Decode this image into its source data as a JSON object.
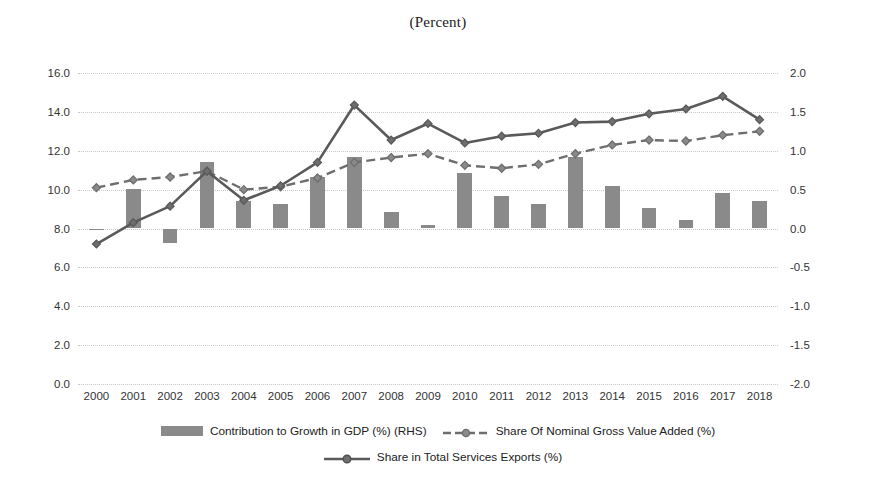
{
  "chart_data": {
    "type": "bar",
    "title": "(Percent)",
    "xlabel": "",
    "ylabel": "",
    "grid": true,
    "legend_position": "bottom",
    "categories": [
      "2000",
      "2001",
      "2002",
      "2003",
      "2004",
      "2005",
      "2006",
      "2007",
      "2008",
      "2009",
      "2010",
      "2011",
      "2012",
      "2013",
      "2014",
      "2015",
      "2016",
      "2017",
      "2018"
    ],
    "axes": {
      "left": {
        "label": "",
        "ylim": [
          0.0,
          16.0
        ],
        "ticks": [
          "16.0",
          "14.0",
          "12.0",
          "10.0",
          "8.0",
          "6.0",
          "4.0",
          "2.0",
          "0.0"
        ],
        "tick_values": [
          16.0,
          14.0,
          12.0,
          10.0,
          8.0,
          6.0,
          4.0,
          2.0,
          0.0
        ]
      },
      "right": {
        "label": "RHS",
        "ylim": [
          -2.0,
          2.0
        ],
        "ticks": [
          "2.0",
          "1.5",
          "1.0",
          "0.5",
          "0.0",
          "-0.5",
          "-1.0",
          "-1.5",
          "-2.0"
        ],
        "tick_values": [
          2.0,
          1.5,
          1.0,
          0.5,
          0.0,
          -0.5,
          -1.0,
          -1.5,
          -2.0
        ]
      }
    },
    "series": [
      {
        "name": "Contribution to Growth in GDP (%) (RHS)",
        "type": "bar",
        "axis": "right",
        "color": "#8a8a8a",
        "values": [
          -0.02,
          0.51,
          -0.19,
          0.86,
          0.36,
          0.31,
          0.66,
          0.92,
          0.21,
          0.05,
          0.71,
          0.42,
          0.31,
          0.92,
          0.55,
          0.26,
          0.11,
          0.46,
          0.36
        ]
      },
      {
        "name": "Share Of Nominal Gross Value Added (%)",
        "type": "line",
        "style": "dashed",
        "axis": "left",
        "color": "#6e6e6e",
        "values": [
          10.1,
          10.5,
          10.65,
          10.95,
          10.0,
          10.15,
          10.6,
          11.4,
          11.65,
          11.85,
          11.25,
          11.1,
          11.3,
          11.85,
          12.3,
          12.55,
          12.5,
          12.8,
          13.0
        ]
      },
      {
        "name": "Share in Total Services Exports (%)",
        "type": "line",
        "style": "solid",
        "axis": "left",
        "color": "#5a5a5a",
        "values": [
          7.2,
          8.3,
          9.15,
          10.95,
          9.45,
          10.2,
          11.4,
          14.35,
          12.55,
          13.4,
          12.4,
          12.75,
          12.9,
          13.45,
          13.5,
          13.9,
          14.15,
          14.8,
          13.6
        ]
      }
    ],
    "legend": [
      {
        "label": "Contribution to Growth in GDP (%) (RHS)",
        "marker": "bar-swatch"
      },
      {
        "label": "Share Of Nominal Gross Value Added (%)",
        "marker": "dashed-diamond-line"
      },
      {
        "label": "Share in Total Services Exports (%)",
        "marker": "solid-diamond-line"
      }
    ]
  }
}
